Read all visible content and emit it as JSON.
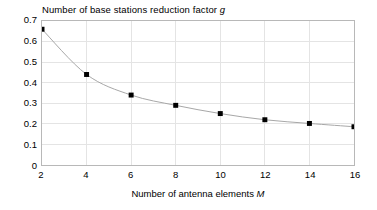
{
  "chart_data": {
    "type": "line",
    "title": "Number of base stations reduction factor g",
    "title_plain": "Number of base stations reduction factor ",
    "title_italic": "g",
    "xlabel": "Number of antenna elements M",
    "xlabel_plain": "Number of antenna elements ",
    "xlabel_italic": "M",
    "ylabel": "",
    "x": [
      2,
      4,
      6,
      8,
      10,
      12,
      14,
      16
    ],
    "values": [
      0.66,
      0.44,
      0.34,
      0.29,
      0.25,
      0.22,
      0.202,
      0.186
    ],
    "series": [
      {
        "name": "g",
        "values": [
          0.66,
          0.44,
          0.34,
          0.29,
          0.25,
          0.22,
          0.202,
          0.186
        ]
      }
    ],
    "xlim": [
      2,
      16
    ],
    "ylim": [
      0,
      0.7
    ],
    "xticks": [
      2,
      4,
      6,
      8,
      10,
      12,
      14,
      16
    ],
    "xtick_labels": [
      "2",
      "4",
      "6",
      "8",
      "10",
      "12",
      "14",
      "16"
    ],
    "yticks": [
      0,
      0.1,
      0.2,
      0.3,
      0.4,
      0.5,
      0.6,
      0.7
    ],
    "ytick_labels": [
      "0",
      "0.1",
      "0.2",
      "0.3",
      "0.4",
      "0.5",
      "0.6",
      "0.7"
    ],
    "grid": true,
    "grid_x": true,
    "grid_y": true,
    "legend": false,
    "legend_position": "none",
    "marker": "square",
    "marker_color": "#000000",
    "line_color": "#a6a6a6",
    "grid_color": "#e4e4e4",
    "frame_color": "#b8b8b8",
    "background_color": "#ffffff"
  }
}
